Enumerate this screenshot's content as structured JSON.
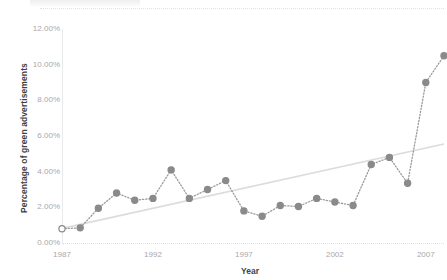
{
  "chart_data": {
    "type": "line",
    "title": "",
    "xlabel": "Year",
    "ylabel": "Percentage of green advertisements",
    "xlim": [
      1987,
      2008
    ],
    "ylim": [
      0,
      12
    ],
    "y_tick_labels": [
      "0.00%",
      "2.00%",
      "4.00%",
      "6.00%",
      "8.00%",
      "10.00%",
      "12.00%"
    ],
    "y_tick_values": [
      0,
      2,
      4,
      6,
      8,
      10,
      12
    ],
    "x_tick_labels": [
      "1987",
      "1992",
      "1997",
      "2002",
      "2007"
    ],
    "x_tick_values": [
      1987,
      1992,
      1997,
      2002,
      2007
    ],
    "grid": false,
    "legend": "none",
    "marker_color": "#8a8a8c",
    "line_color": "#9a9a9c",
    "line_style": "dotted",
    "trendline_color": "#dcdcde",
    "x": [
      1987,
      1988,
      1989,
      1990,
      1991,
      1992,
      1993,
      1994,
      1995,
      1996,
      1997,
      1998,
      1999,
      2000,
      2001,
      2002,
      2003,
      2004,
      2005,
      2006,
      2007,
      2008
    ],
    "values": [
      0.8,
      0.85,
      1.95,
      2.8,
      2.4,
      2.5,
      4.1,
      2.5,
      3.0,
      3.5,
      1.8,
      1.5,
      2.1,
      2.05,
      2.5,
      2.3,
      2.1,
      4.4,
      4.8,
      3.35,
      9.0,
      10.5
    ],
    "series": [
      {
        "name": "Percentage of green advertisements",
        "values": [
          0.8,
          0.85,
          1.95,
          2.8,
          2.4,
          2.5,
          4.1,
          2.5,
          3.0,
          3.5,
          1.8,
          1.5,
          2.1,
          2.05,
          2.5,
          2.3,
          2.1,
          4.4,
          4.8,
          3.35,
          9.0,
          10.5
        ]
      }
    ],
    "trendline": {
      "x_start": 1987,
      "y_start": 0.82,
      "x_end": 2008,
      "y_end": 5.55
    }
  }
}
